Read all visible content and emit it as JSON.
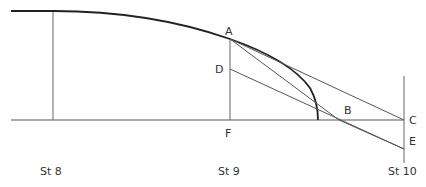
{
  "diagram": {
    "points": {
      "A": {
        "label": "A",
        "x": 230,
        "y": 39
      },
      "B": {
        "label": "B",
        "x": 339,
        "y": 120
      },
      "C": {
        "label": "C",
        "x": 404,
        "y": 120
      },
      "D": {
        "label": "D",
        "x": 230,
        "y": 69
      },
      "E": {
        "label": "E",
        "x": 404,
        "y": 149
      },
      "F": {
        "label": "F",
        "x": 230,
        "y": 120
      }
    },
    "stations": [
      {
        "label": "St 8",
        "x": 53
      },
      {
        "label": "St 9",
        "x": 230
      },
      {
        "label": "St 10",
        "x": 404
      }
    ],
    "colors": {
      "curve": "#222222",
      "lines": "#555555",
      "text": "#333333"
    }
  }
}
